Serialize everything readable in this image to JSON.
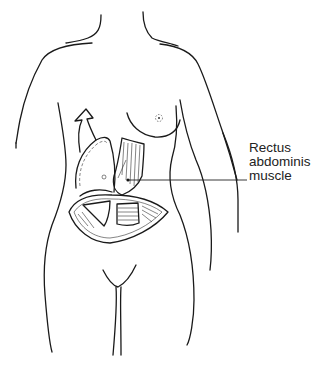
{
  "figure": {
    "label": {
      "lines": [
        "Rectus",
        "abdominis",
        "muscle"
      ],
      "target": "rectus-abdominis-muscle-flap"
    },
    "colors": {
      "line": "#1a1a1a",
      "background": "#ffffff"
    }
  }
}
